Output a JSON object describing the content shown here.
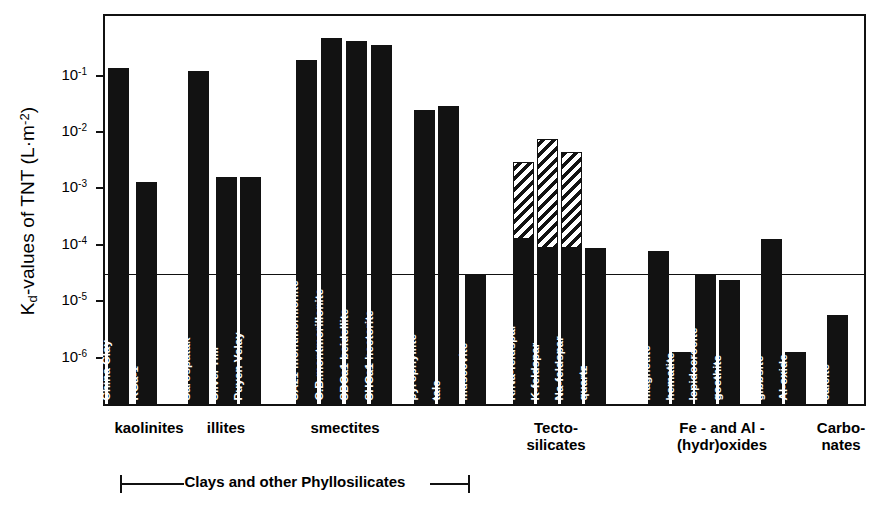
{
  "chart_data": {
    "type": "bar",
    "title": "",
    "xlabel": "",
    "ylabel": "Kd-values of TNT (L·m-2)",
    "yscale": "log",
    "ylim": [
      3.5e-07,
      1.0
    ],
    "grid": false,
    "legend": null,
    "reference_line": {
      "value": 3e-05,
      "label": ""
    },
    "ytick_labels": [
      "10-1",
      "10-2",
      "10-3",
      "10-4",
      "10-5",
      "10-6"
    ],
    "ytick_values": [
      0.1,
      0.01,
      0.001,
      0.0001,
      1e-05,
      1e-06
    ],
    "categories": [
      "China Clay",
      "KGa-1",
      "Sarospatak",
      "Silver Hill",
      "Puyen Velay",
      "SAz1 montmorillonite",
      "C.B.montmorillonite",
      "SBCa1 beidellite",
      "SHCa1 hectorite",
      "pyrophyllite",
      "talc",
      "muscovite",
      "K/Na-feldspar",
      "K-feldspar",
      "Na-feldspar",
      "quartz",
      "magnetite",
      "hematite",
      "lepidocrocite",
      "goethite",
      "gibbsite",
      "Al-oxide",
      "calcite"
    ],
    "values": [
      0.14,
      0.0013,
      0.125,
      0.0016,
      0.0016,
      0.19,
      0.47,
      0.42,
      0.35,
      0.025,
      0.029,
      3e-05,
      0.003,
      0.0077,
      0.0045,
      9e-05,
      8e-05,
      1.3e-06,
      3.1e-05,
      2.4e-05,
      0.00013,
      1.3e-06,
      5.8e-06
    ],
    "solid_portion_values": [
      null,
      null,
      null,
      null,
      null,
      null,
      null,
      null,
      null,
      null,
      null,
      null,
      0.00013,
      9e-05,
      9e-05,
      null,
      null,
      null,
      null,
      null,
      null,
      null,
      null
    ],
    "series_note": "hatched upper segment = upper bound estimate; solid lower segment = measured value",
    "groups": [
      {
        "label": "kaolinites",
        "members": [
          "China Clay",
          "KGa-1"
        ]
      },
      {
        "label": "illites",
        "members": [
          "Sarospatak",
          "Silver Hill",
          "Puyen Velay"
        ]
      },
      {
        "label": "smectites",
        "members": [
          "SAz1 montmorillonite",
          "C.B.montmorillonite",
          "SBCa1 beidellite",
          "SHCa1 hectorite"
        ]
      },
      {
        "label": "Tecto-\nsilicates",
        "members": [
          "K/Na-feldspar",
          "K-feldspar",
          "Na-feldspar",
          "quartz"
        ]
      },
      {
        "label": "Fe -  and  Al -\n(hydr)oxides",
        "members": [
          "magnetite",
          "hematite",
          "lepidocrocite",
          "goethite",
          "gibbsite",
          "Al-oxide"
        ]
      },
      {
        "label": "Carbo-\nnates",
        "members": [
          "calcite"
        ]
      }
    ],
    "bracket": {
      "label": "Clays and other Phyllosilicates"
    }
  },
  "axis": {
    "ylabel_prefix": "K",
    "ylabel_sub": "d",
    "ylabel_mid": "-values of TNT (L·m",
    "ylabel_sup": "-2",
    "ylabel_suffix": ")"
  }
}
